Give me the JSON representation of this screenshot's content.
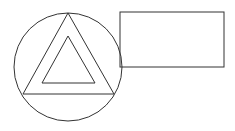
{
  "diagram": {
    "background": "#ffffff",
    "stroke": "#333333",
    "stroke_width": 1,
    "shapes": [
      {
        "type": "circle",
        "name": "circle",
        "cx": 68,
        "cy": 67,
        "r": 54
      },
      {
        "type": "triangle",
        "name": "outer-triangle",
        "points": "68,13 23,94 114,94"
      },
      {
        "type": "triangle",
        "name": "inner-triangle",
        "points": "68,36 42,83 95,83"
      },
      {
        "type": "rectangle",
        "name": "rectangle",
        "x": 120,
        "y": 12,
        "width": 104,
        "height": 55
      }
    ]
  }
}
